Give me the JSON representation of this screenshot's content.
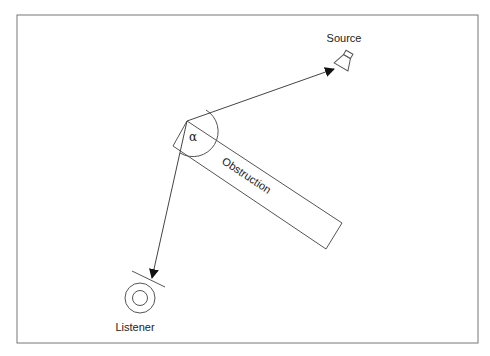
{
  "diagram": {
    "title": "",
    "labels": {
      "source": "Source",
      "listener": "Listener",
      "obstruction": "Obstruction",
      "angle": "α"
    },
    "colors": {
      "stroke": "#555555",
      "text": "#222222",
      "background": "#ffffff"
    },
    "nodes": [
      {
        "id": "source",
        "label": "Source",
        "icon": "speaker-icon"
      },
      {
        "id": "listener",
        "label": "Listener",
        "icon": "listener-icon"
      },
      {
        "id": "obstruction",
        "label": "Obstruction",
        "shape": "rotated-rectangle"
      }
    ],
    "edges": [
      {
        "from": "obstruction-corner",
        "to": "source",
        "style": "arrow"
      },
      {
        "from": "obstruction-corner",
        "to": "listener",
        "style": "arrow"
      }
    ],
    "annotations": [
      {
        "label": "α",
        "meaning": "diffraction angle at obstruction edge"
      }
    ]
  }
}
